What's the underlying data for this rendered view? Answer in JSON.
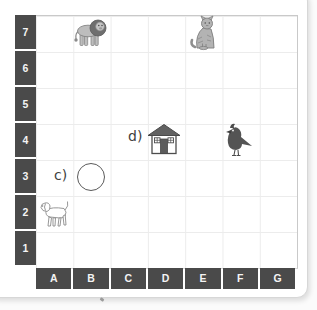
{
  "page": {
    "background": "#fbfbfb",
    "card_color": "#ffffff"
  },
  "grid": {
    "row_labels": [
      "7",
      "6",
      "5",
      "4",
      "3",
      "2",
      "1"
    ],
    "col_labels": [
      "A",
      "B",
      "C",
      "D",
      "E",
      "F",
      "G"
    ],
    "header_bg": "#4a4a4a",
    "header_text_color": "#f4f4f4",
    "line_color": "#ececec",
    "border_color": "#c9c9c9"
  },
  "annotations": {
    "c_label": "c)",
    "d_label": "d)"
  },
  "items": [
    {
      "name": "lion-icon",
      "cell": "B7"
    },
    {
      "name": "cat-icon",
      "cell": "E7"
    },
    {
      "name": "house-icon",
      "cell": "D4",
      "label": "d)"
    },
    {
      "name": "bird-icon",
      "cell": "F4"
    },
    {
      "name": "circle-shape",
      "cell": "B3",
      "label": "c)"
    },
    {
      "name": "dog-icon",
      "cell": "A2"
    }
  ]
}
